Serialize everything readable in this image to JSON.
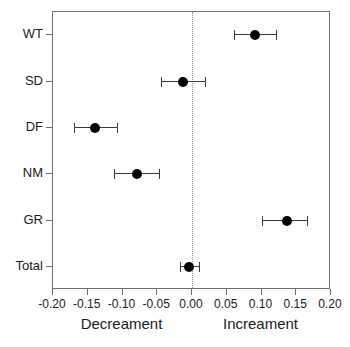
{
  "chart_data": {
    "type": "scatter",
    "title": "",
    "subtitle": "",
    "xlabel": "",
    "ylabel": "",
    "xlim": [
      -0.2,
      0.2
    ],
    "xticks": [
      -0.2,
      -0.15,
      -0.1,
      -0.05,
      0.0,
      0.05,
      0.1,
      0.15,
      0.2
    ],
    "xticklabels": [
      "-0.20",
      "-0.15",
      "-0.10",
      "-0.05",
      "0.00",
      "0.05",
      "0.10",
      "0.15",
      "0.20"
    ],
    "categories": [
      "WT",
      "SD",
      "DF",
      "NM",
      "GR",
      "Total"
    ],
    "grid": false,
    "legend": null,
    "reference_line": 0.0,
    "reference_line_style": "dotted",
    "marker": "filled-circle",
    "marker_color": "#000000",
    "error_bar_color": "#3a3a3a",
    "frame_color": "#6f6f6f",
    "series": [
      {
        "name": "effect estimate",
        "values": [
          0.091,
          -0.013,
          -0.14,
          -0.079,
          0.136,
          -0.004
        ],
        "ci_low": [
          0.061,
          -0.045,
          -0.17,
          -0.112,
          0.101,
          -0.017
        ],
        "ci_high": [
          0.121,
          0.018,
          -0.108,
          -0.048,
          0.166,
          0.01
        ]
      }
    ],
    "annotations": [
      {
        "text": "Decreament",
        "x": -0.1
      },
      {
        "text": "Increament",
        "x": 0.1
      }
    ]
  },
  "axis": {
    "left_direction_label": "Decreament",
    "right_direction_label": "Increament"
  }
}
